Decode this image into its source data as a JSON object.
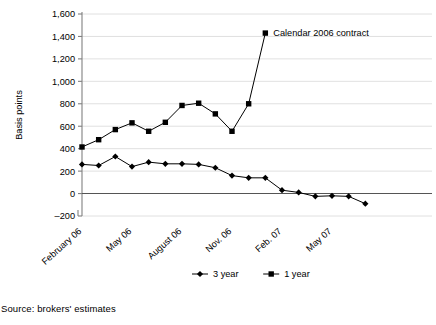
{
  "figure": {
    "source_note": "Source: brokers' estimates",
    "annotation": {
      "text": "Calendar 2006 contract"
    }
  },
  "chart_data": {
    "type": "line",
    "title": "",
    "xlabel": "",
    "ylabel": "Basis points",
    "ylim": [
      -200,
      1600
    ],
    "yticks": [
      -200,
      0,
      200,
      400,
      600,
      800,
      1000,
      1200,
      1400,
      1600
    ],
    "ytick_labels": [
      "–200",
      "0",
      "200",
      "400",
      "600",
      "800",
      "1,000",
      "1,200",
      "1,400",
      "1,600"
    ],
    "grid": true,
    "grid_axis": "y",
    "legend_position": "bottom",
    "x": [
      "February 06",
      "March 06",
      "April 06",
      "May 06",
      "June 06",
      "July 06",
      "August 06",
      "September 06",
      "October 06",
      "Nov. 06",
      "December 06",
      "January 07",
      "Feb. 07",
      "March 07",
      "April 07",
      "May 07",
      "June 07",
      "July 07"
    ],
    "xtick_labels": [
      "February 06",
      "May 06",
      "August 06",
      "Nov. 06",
      "Feb. 07",
      "May 07"
    ],
    "xtick_indices": [
      0,
      3,
      6,
      9,
      12,
      15
    ],
    "series": [
      {
        "name": "3 year",
        "marker": "diamond",
        "color": "#000000",
        "values": [
          260,
          250,
          330,
          240,
          280,
          265,
          265,
          260,
          230,
          160,
          140,
          140,
          30,
          10,
          -25,
          -20,
          -25,
          -90
        ]
      },
      {
        "name": "1 year",
        "marker": "square",
        "color": "#000000",
        "values": [
          415,
          480,
          570,
          630,
          555,
          635,
          785,
          805,
          710,
          555,
          800,
          1430,
          null,
          null,
          null,
          null,
          null,
          null
        ]
      }
    ],
    "annotations": [
      {
        "text": "Calendar 2006 contract",
        "x_index": 11,
        "y": 1430
      }
    ]
  },
  "legend": {
    "items": [
      {
        "label": "3 year",
        "marker": "diamond"
      },
      {
        "label": "1 year",
        "marker": "square"
      }
    ]
  }
}
